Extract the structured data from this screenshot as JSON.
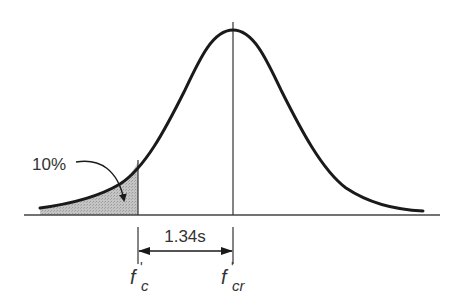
{
  "diagram": {
    "type": "normal-distribution",
    "labels": {
      "tail_percent": "10%",
      "offset": "1.34s",
      "fc_main": "f",
      "fc_prime": "'",
      "fc_sub": "c",
      "fcr_main": "f",
      "fcr_prime": "'",
      "fcr_sub": "cr"
    },
    "colors": {
      "curve": "#1a1a1a",
      "axis": "#444444",
      "shaded_area": "#b8b8b8",
      "text": "#333333"
    }
  }
}
